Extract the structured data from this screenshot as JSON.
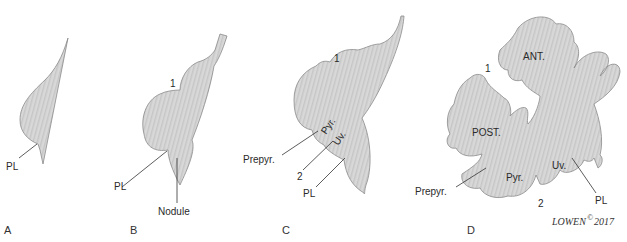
{
  "figure": {
    "colors": {
      "fill": "#d6d6d6",
      "stripe": "#c4c4c4",
      "outline": "#8a8a8a",
      "text": "#2a2a2a"
    },
    "panels": [
      {
        "id": "A",
        "label": "A",
        "annotations": [
          "PL"
        ]
      },
      {
        "id": "B",
        "label": "B",
        "annotations": [
          "1",
          "PL",
          "Nodule"
        ]
      },
      {
        "id": "C",
        "label": "C",
        "annotations": [
          "1",
          "Prepyr.",
          "Pyr.",
          "Uv.",
          "2",
          "PL"
        ]
      },
      {
        "id": "D",
        "label": "D",
        "annotations": [
          "ANT.",
          "1",
          "POST.",
          "Prepyr.",
          "Pyr.",
          "Uv.",
          "2",
          "PL"
        ]
      }
    ],
    "labels": {
      "a_pl": "PL",
      "b_1": "1",
      "b_pl": "PL",
      "b_nodule": "Nodule",
      "c_1": "1",
      "c_prepyr": "Prepyr.",
      "c_pyr": "Pyr.",
      "c_uv": "Uv.",
      "c_2": "2",
      "c_pl": "PL",
      "d_ant": "ANT.",
      "d_1": "1",
      "d_post": "POST.",
      "d_prepyr": "Prepyr.",
      "d_pyr": "Pyr.",
      "d_uv": "Uv.",
      "d_2": "2",
      "d_pl": "PL"
    },
    "panel_letters": {
      "a": "A",
      "b": "B",
      "c": "C",
      "d": "D"
    },
    "signature": "LOWEN",
    "copyright": "©",
    "year": "2017"
  }
}
